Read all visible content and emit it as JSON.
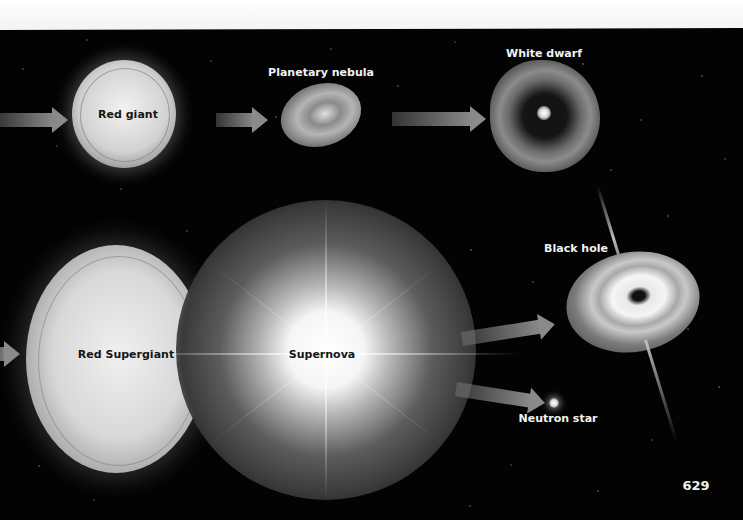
{
  "diagram": {
    "stages": {
      "red_giant": "Red giant",
      "planetary_nebula": "Planetary nebula",
      "white_dwarf": "White dwarf",
      "red_supergiant": "Red Supergiant",
      "supernova": "Supernova",
      "black_hole": "Black hole",
      "neutron_star": "Neutron star"
    },
    "flows": [
      {
        "from": "(off-page)",
        "to": "Red giant"
      },
      {
        "from": "Red giant",
        "to": "Planetary nebula"
      },
      {
        "from": "Planetary nebula",
        "to": "White dwarf"
      },
      {
        "from": "(off-page)",
        "to": "Red Supergiant"
      },
      {
        "from": "Supernova",
        "to": "Black hole"
      },
      {
        "from": "Supernova",
        "to": "Neutron star"
      }
    ]
  },
  "page": {
    "number": "629"
  },
  "colors": {
    "background": "#030303",
    "page_margin": "#ffffff",
    "arrow": "#8a8a8a",
    "label_light": "#f2f2f2",
    "label_dark": "#151515"
  }
}
